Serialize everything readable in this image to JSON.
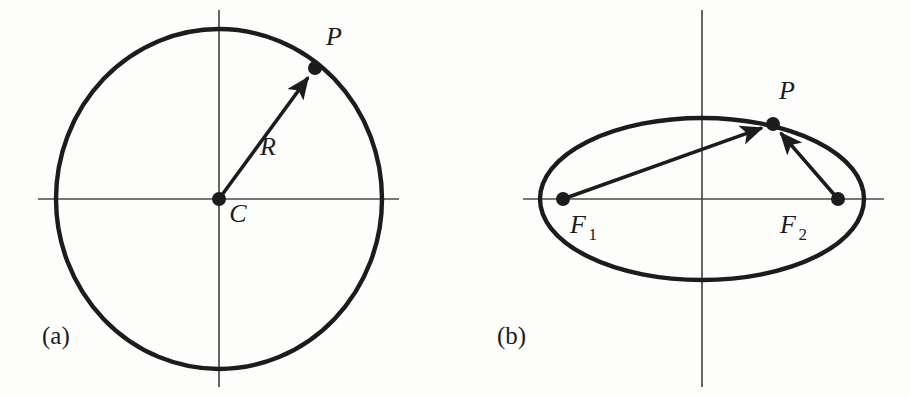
{
  "figure": {
    "background_color": "#fdfdfc",
    "ink_color": "#1c1c1c",
    "axis_color": "#4a4a4a",
    "width": 910,
    "height": 396
  },
  "panel_a": {
    "caption": "(a)",
    "caption_x": 42,
    "caption_y": 344,
    "shape": "circle",
    "center": {
      "x": 219,
      "y": 199
    },
    "radius_x": 163,
    "radius_y": 170,
    "axes": {
      "h_axis_x1": 38,
      "h_axis_x2": 399,
      "v_axis_y1": 10,
      "v_axis_y2": 387
    },
    "points": [
      {
        "name": "C",
        "label": "C",
        "x": 219,
        "y": 199,
        "label_x": 238,
        "label_y": 222,
        "dot_r": 7
      },
      {
        "name": "P",
        "label": "P",
        "x": 315,
        "y": 68,
        "label_x": 334,
        "label_y": 45,
        "dot_r": 7
      }
    ],
    "vectors": [
      {
        "name": "R",
        "label": "R",
        "from": "C",
        "to": "P",
        "x1": 219,
        "y1": 199,
        "x2": 315,
        "y2": 68,
        "label_x": 268,
        "label_y": 155
      }
    ]
  },
  "panel_b": {
    "caption": "(b)",
    "caption_x": 497,
    "caption_y": 344,
    "shape": "ellipse",
    "center": {
      "x": 702,
      "y": 199
    },
    "radius_x": 162,
    "radius_y": 81,
    "axes": {
      "h_axis_x1": 523,
      "h_axis_x2": 884,
      "v_axis_y1": 10,
      "v_axis_y2": 387
    },
    "points": [
      {
        "name": "F1",
        "label": "F",
        "subscript": "1",
        "x": 563,
        "y": 199,
        "label_x": 578,
        "label_y": 233,
        "dot_r": 7
      },
      {
        "name": "F2",
        "label": "F",
        "subscript": "2",
        "x": 838,
        "y": 199,
        "label_x": 788,
        "label_y": 233,
        "dot_r": 7
      },
      {
        "name": "P",
        "label": "P",
        "x": 773,
        "y": 124,
        "label_x": 787,
        "label_y": 99,
        "dot_r": 7
      }
    ],
    "vectors": [
      {
        "name": "r1",
        "from": "F1",
        "to": "P",
        "x1": 563,
        "y1": 199,
        "x2": 773,
        "y2": 124
      },
      {
        "name": "r2",
        "from": "F2",
        "to": "P",
        "x1": 838,
        "y1": 199,
        "x2": 773,
        "y2": 124
      }
    ]
  },
  "typography": {
    "math_font_size": 26,
    "sub_font_size": 17,
    "caption_font_size": 25
  }
}
